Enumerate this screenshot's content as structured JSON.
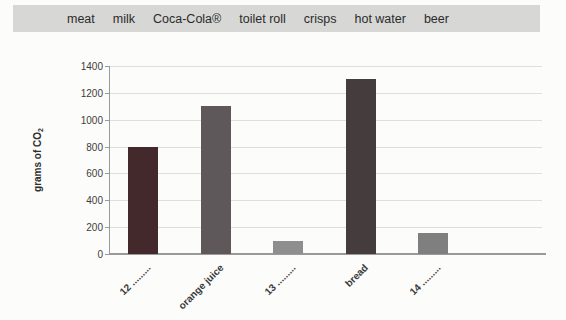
{
  "word_bank": {
    "items": [
      "meat",
      "milk",
      "Coca-Cola®",
      "toilet roll",
      "crisps",
      "hot water",
      "beer"
    ],
    "bg_color": "#d7d7d5"
  },
  "chart_data": {
    "type": "bar",
    "title": "",
    "xlabel": "",
    "ylabel": "grams of CO2",
    "ylabel_main": "grams of CO",
    "ylabel_sub": "2",
    "ylim": [
      0,
      1400
    ],
    "yticks": [
      0,
      200,
      400,
      600,
      800,
      1000,
      1200,
      1400
    ],
    "grid": true,
    "legend": "none",
    "categories": [
      "12 .........",
      "orange juice",
      "13 .........",
      "bread",
      "14 ........."
    ],
    "values": [
      800,
      1100,
      100,
      1300,
      160
    ],
    "bar_colors": [
      "#43282c",
      "#5e585a",
      "#8e8e8e",
      "#453c3e",
      "#7f7f7f"
    ],
    "gridline_color": "#dedede",
    "axis_color": "#9a9a9a"
  }
}
